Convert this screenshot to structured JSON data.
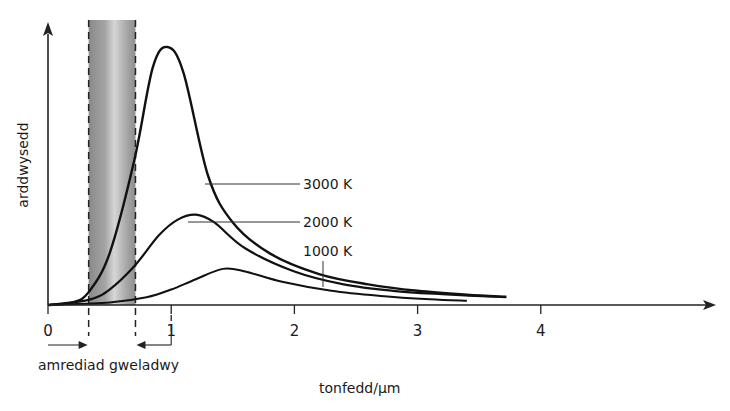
{
  "chart_data": {
    "type": "line",
    "title": "",
    "xlabel": "tonfedd/µm",
    "ylabel": "arddwysedd",
    "xlim": [
      0,
      5.4
    ],
    "ylim": [
      0,
      1.1
    ],
    "x_ticks": [
      0,
      1,
      2,
      3,
      4
    ],
    "x_tick_labels": [
      "0",
      "1",
      "2",
      "3",
      "4"
    ],
    "y_ticks": [],
    "grid": false,
    "visible_band": {
      "label": "amrediad gweladwy",
      "x_range_um": [
        0.33,
        0.71
      ]
    },
    "series": [
      {
        "name": "3000 K",
        "x": [
          0,
          0.2,
          0.33,
          0.5,
          0.7,
          0.85,
          0.97,
          1.1,
          1.3,
          1.5,
          1.8,
          2.2,
          2.6,
          3.0,
          3.4,
          3.72
        ],
        "y": [
          0,
          0.01,
          0.05,
          0.2,
          0.56,
          0.92,
          1.0,
          0.9,
          0.5,
          0.32,
          0.2,
          0.12,
          0.08,
          0.055,
          0.04,
          0.032
        ]
      },
      {
        "name": "2000 K",
        "x": [
          0,
          0.33,
          0.5,
          0.7,
          0.9,
          1.05,
          1.2,
          1.35,
          1.6,
          2.0,
          2.4,
          2.8,
          3.2,
          3.72
        ],
        "y": [
          0,
          0.02,
          0.06,
          0.15,
          0.27,
          0.33,
          0.35,
          0.32,
          0.22,
          0.13,
          0.08,
          0.055,
          0.042,
          0.03
        ]
      },
      {
        "name": "1000 K",
        "x": [
          0,
          0.5,
          0.8,
          1.0,
          1.2,
          1.42,
          1.6,
          1.9,
          2.3,
          2.7,
          3.1,
          3.4
        ],
        "y": [
          0,
          0.01,
          0.03,
          0.06,
          0.1,
          0.14,
          0.13,
          0.09,
          0.055,
          0.035,
          0.022,
          0.016
        ]
      }
    ],
    "annotations": [
      {
        "text": "3000 K",
        "points_to_series": "3000 K"
      },
      {
        "text": "2000 K",
        "points_to_series": "2000 K"
      },
      {
        "text": "1000 K",
        "points_to_series": "1000 K"
      }
    ]
  }
}
